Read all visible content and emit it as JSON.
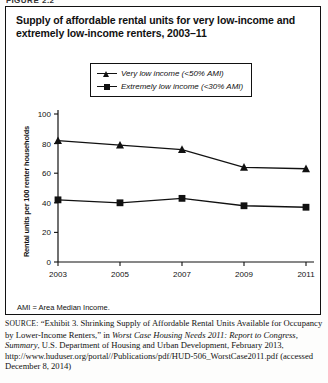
{
  "figure_tag": "FIGURE 2.2",
  "chart": {
    "title": "Supply of affordable rental units for very low-income and extremely low-income renters, 2003–11",
    "note": "AMI = Area Median Income."
  },
  "source": {
    "label": "SOURCE:",
    "part1": " “Exhibit 3. Shrinking Supply of Affordable Rental Units Available for Occupancy by Lower-Income Renters,” in ",
    "italic1": "Worst Case Housing Needs 2011: Report to Congress, Summary",
    "part2": ", U.S. Department of Housing and Urban Development, February 2013, http://www.huduser.org/portal//Publications/pdf/HUD-506_WorstCase2011.pdf (accessed December 8, 2014)"
  },
  "chart_data": {
    "type": "line",
    "title": "Supply of affordable rental units for very low-income and extremely low-income renters, 2003–11",
    "xlabel": "",
    "ylabel": "Rental units per 100 renter households",
    "categories": [
      "2003",
      "2005",
      "2007",
      "2009",
      "2011"
    ],
    "x": [
      2003,
      2005,
      2007,
      2009,
      2011
    ],
    "xlim": [
      2003,
      2011
    ],
    "ylim": [
      0,
      100
    ],
    "yticks": [
      0,
      20,
      40,
      60,
      80,
      100
    ],
    "ytick_labels": [
      "0",
      "20",
      "40",
      "60",
      "80",
      "100"
    ],
    "grid": false,
    "legend_position": "top-center",
    "series": [
      {
        "name": "Very low income (<50% AMI)",
        "marker": "triangle",
        "color": "#111111",
        "values": [
          82,
          79,
          76,
          64,
          63
        ]
      },
      {
        "name": "Extremely low income (<30% AMI)",
        "marker": "square",
        "color": "#111111",
        "values": [
          42,
          40,
          43,
          38,
          37
        ]
      }
    ]
  }
}
